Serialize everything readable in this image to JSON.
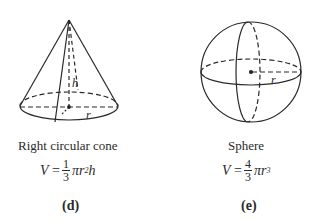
{
  "figures": [
    {
      "id": "d",
      "caption": "Right circular cone",
      "formula": {
        "lhs": "V",
        "eq": "=",
        "num": "1",
        "den": "3",
        "rhs_base": "πr",
        "exp": "2",
        "tail": "h"
      },
      "label": "(d)",
      "annotations": {
        "height": "h",
        "radius": "r"
      }
    },
    {
      "id": "e",
      "caption": "Sphere",
      "formula": {
        "lhs": "V",
        "eq": "=",
        "num": "4",
        "den": "3",
        "rhs_base": "πr",
        "exp": "3",
        "tail": ""
      },
      "label": "(e)",
      "annotations": {
        "radius": "r"
      }
    }
  ],
  "colors": {
    "stroke": "#2a2a2a",
    "background": "#ffffff"
  }
}
